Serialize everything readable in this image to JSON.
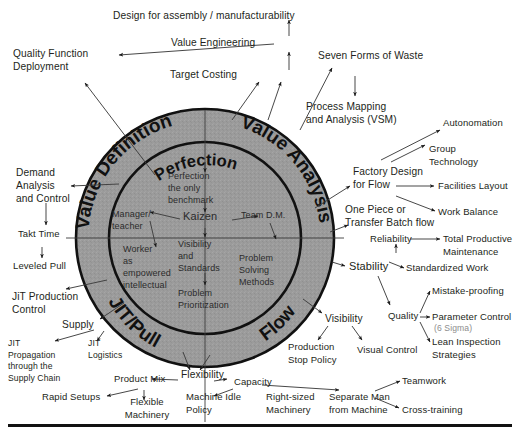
{
  "diagram": {
    "colors": {
      "ring_fill": "#9b9b9b",
      "ring_stroke": "#111111",
      "text": "#231f20",
      "muted_text": "#8d8d8d",
      "background": "#ffffff"
    },
    "rings": {
      "outer": [
        {
          "id": "value-definition",
          "label": "Value Definition"
        },
        {
          "id": "value-analysis",
          "label": "Value Analysis"
        },
        {
          "id": "jit-pull",
          "label": "JIT/Pull"
        },
        {
          "id": "flow",
          "label": "Flow"
        }
      ],
      "inner": [
        {
          "id": "perfection",
          "label": "Perfection"
        }
      ]
    },
    "core_nodes": [
      {
        "id": "perfection-benchmark",
        "label": "Perfection\nthe only\nbenchmark"
      },
      {
        "id": "kaizen",
        "label": "Kaizen"
      },
      {
        "id": "manager-teacher",
        "label": "Manager/\nteacher"
      },
      {
        "id": "team-dm",
        "label": "Team D.M."
      },
      {
        "id": "visibility-standards",
        "label": "Visibility\nand\nStandards"
      },
      {
        "id": "worker-empowered",
        "label": "Worker\nas\nempowered\nintellectual"
      },
      {
        "id": "problem-solving-methods",
        "label": "Problem\nSolving\nMethods"
      },
      {
        "id": "problem-prioritization",
        "label": "Problem\nPrioritization"
      }
    ],
    "outer_nodes": [
      {
        "id": "design-for-assembly",
        "label": "Design for assembly / manufacturability"
      },
      {
        "id": "value-engineering",
        "label": "Value Engineering"
      },
      {
        "id": "target-costing",
        "label": "Target Costing"
      },
      {
        "id": "quality-function-deployment",
        "label": "Quality Function\nDeployment"
      },
      {
        "id": "seven-forms-of-waste",
        "label": "Seven Forms of Waste"
      },
      {
        "id": "process-mapping-vsm",
        "label": "Process Mapping\nand Analysis (VSM)"
      },
      {
        "id": "demand-analysis-control",
        "label": "Demand\nAnalysis\nand Control"
      },
      {
        "id": "takt-time",
        "label": "Takt Time"
      },
      {
        "id": "leveled-pull",
        "label": "Leveled Pull"
      },
      {
        "id": "jit-production-control",
        "label": "JiT Production\nControl"
      },
      {
        "id": "supply",
        "label": "Supply"
      },
      {
        "id": "jit-propagation",
        "label": "JIT\nPropagation\nthrough the\nSupply Chain"
      },
      {
        "id": "jit-logistics",
        "label": "JIT\nLogistics"
      },
      {
        "id": "product-mix",
        "label": "Product Mix"
      },
      {
        "id": "rapid-setups",
        "label": "Rapid Setups"
      },
      {
        "id": "flexible-machinery",
        "label": "Flexible\nMachinery"
      },
      {
        "id": "flexibility",
        "label": "Flexibility"
      },
      {
        "id": "machine-idle-policy",
        "label": "Machine Idle\nPolicy"
      },
      {
        "id": "capacity",
        "label": "Capacity"
      },
      {
        "id": "right-sized-machinery",
        "label": "Right-sized\nMachinery"
      },
      {
        "id": "separate-man-from-machine",
        "label": "Separate Man\nfrom Machine"
      },
      {
        "id": "teamwork",
        "label": "Teamwork"
      },
      {
        "id": "cross-training",
        "label": "Cross-training"
      },
      {
        "id": "factory-design-for-flow",
        "label": "Factory Design\nfor Flow"
      },
      {
        "id": "one-piece-transfer-batch",
        "label": "One Piece or\nTransfer Batch flow"
      },
      {
        "id": "autonomation",
        "label": "Autonomation"
      },
      {
        "id": "group-technology",
        "label": "Group\nTechnology"
      },
      {
        "id": "facilities-layout",
        "label": "Facilities Layout"
      },
      {
        "id": "work-balance",
        "label": "Work Balance"
      },
      {
        "id": "reliability",
        "label": "Reliability"
      },
      {
        "id": "total-productive-maintenance",
        "label": "Total Productive\nMaintenance"
      },
      {
        "id": "stability",
        "label": "Stability"
      },
      {
        "id": "standardized-work",
        "label": "Standardized Work"
      },
      {
        "id": "quality",
        "label": "Quality"
      },
      {
        "id": "mistake-proofing",
        "label": "Mistake-proofing"
      },
      {
        "id": "parameter-control",
        "label": "Parameter Control"
      },
      {
        "id": "six-sigma",
        "label": "(6 Sigma)"
      },
      {
        "id": "lean-inspection-strategies",
        "label": "Lean Inspection\nStrategies"
      },
      {
        "id": "visibility",
        "label": "Visibility"
      },
      {
        "id": "production-stop-policy",
        "label": "Production\nStop Policy"
      },
      {
        "id": "visual-control",
        "label": "Visual Control"
      }
    ]
  }
}
